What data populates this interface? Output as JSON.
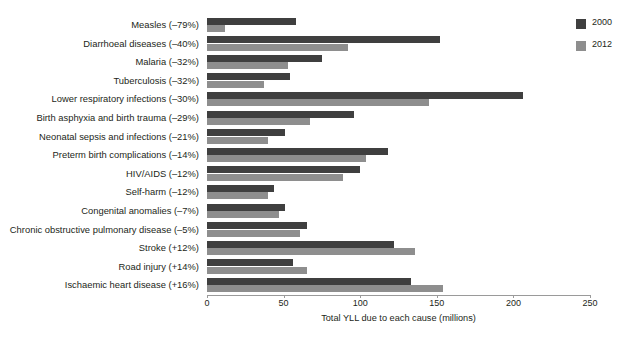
{
  "title_remnant": "",
  "legend": {
    "position": "top-right",
    "entries": [
      {
        "label": "2000",
        "color": "#3f3f3f",
        "swatch_name": "legend-swatch-2000"
      },
      {
        "label": "2012",
        "color": "#8e8e8e",
        "swatch_name": "legend-swatch-2012"
      }
    ]
  },
  "axis": {
    "xlabel": "Total YLL due to each cause (millions)",
    "ticks": [
      "0",
      "50",
      "100",
      "150",
      "200",
      "250"
    ]
  },
  "chart_data": {
    "type": "bar",
    "orientation": "horizontal",
    "title": "",
    "xlabel": "Total YLL due to each cause (millions)",
    "ylabel": "",
    "xlim": [
      0,
      250
    ],
    "xticks": [
      0,
      50,
      100,
      150,
      200,
      250
    ],
    "grid": false,
    "legend_position": "top-right",
    "categories": [
      "Measles (–79%)",
      "Diarrhoeal diseases (–40%)",
      "Malaria (–32%)",
      "Tuberculosis (–32%)",
      "Lower respiratory infections (–30%)",
      "Birth asphyxia and birth trauma (–29%)",
      "Neonatal sepsis and infections (–21%)",
      "Preterm birth complications (–14%)",
      "HIV/AIDS (–12%)",
      "Self-harm (–12%)",
      "Congenital anomalies  (–7%)",
      "Chronic obstructive pulmonary disease  (–5%)",
      "Stroke (+12%)",
      "Road injury (+14%)",
      "Ischaemic heart disease (+16%)"
    ],
    "percent_change": [
      "–79%",
      "–40%",
      "–32%",
      "–32%",
      "–30%",
      "–29%",
      "–21%",
      "–14%",
      "–12%",
      "–12%",
      "–7%",
      "–5%",
      "+12%",
      "+14%",
      "+16%"
    ],
    "series": [
      {
        "name": "2000",
        "color": "#3f3f3f",
        "values": [
          58,
          152,
          75,
          54,
          206,
          96,
          51,
          118,
          100,
          44,
          51,
          65,
          122,
          56,
          133
        ]
      },
      {
        "name": "2012",
        "color": "#8e8e8e",
        "values": [
          12,
          92,
          53,
          37,
          145,
          67,
          40,
          104,
          89,
          40,
          47,
          61,
          136,
          65,
          154
        ]
      }
    ]
  }
}
